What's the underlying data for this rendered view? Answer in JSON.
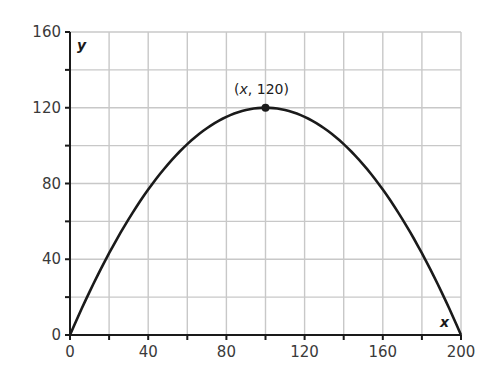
{
  "chart_data": {
    "type": "line",
    "title": "",
    "xlabel": "x",
    "ylabel": "y",
    "xlim": [
      0,
      200
    ],
    "ylim": [
      0,
      160
    ],
    "grid": true,
    "x_ticks": [
      0,
      40,
      80,
      120,
      160,
      200
    ],
    "y_ticks": [
      0,
      40,
      80,
      120,
      160
    ],
    "minor_step": 20,
    "series": [
      {
        "name": "parabola",
        "equation": "y = 2.4x - 0.012x^2",
        "x": [
          0,
          20,
          40,
          60,
          80,
          100,
          120,
          140,
          160,
          180,
          200
        ],
        "values": [
          0,
          43.2,
          76.8,
          100.8,
          115.2,
          120,
          115.2,
          100.8,
          76.8,
          43.2,
          0
        ]
      }
    ],
    "annotations": [
      {
        "text": "(x, 120)",
        "x": 100,
        "y": 120,
        "marker": "dot"
      }
    ]
  },
  "labels": {
    "x_axis_var": "x",
    "y_axis_var": "y",
    "vertex_label_open": "(",
    "vertex_label_var": "x",
    "vertex_label_rest": ", 120)"
  },
  "colors": {
    "grid": "#c8c8c8",
    "axis": "#1a1a1a",
    "curve": "#1a1a1a"
  }
}
